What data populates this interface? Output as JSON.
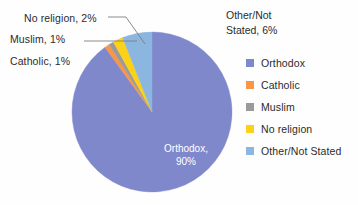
{
  "chart_data": {
    "type": "pie",
    "title": "",
    "categories": [
      "Orthodox",
      "Catholic",
      "Muslim",
      "No religion",
      "Other/Not Stated"
    ],
    "values": [
      90,
      1,
      1,
      2,
      6
    ],
    "value_unit": "%",
    "colors": [
      "#8088cc",
      "#f79646",
      "#9a9a9a",
      "#fcd116",
      "#8ab6e0"
    ],
    "legend_position": "right",
    "grid": false,
    "start_angle_deg": 0,
    "direction": "clockwise",
    "data_labels": [
      {
        "key": "noreligion",
        "text": "No religion, 2%",
        "placement": "outside-left",
        "leader": true
      },
      {
        "key": "muslim",
        "text": "Muslim, 1%",
        "placement": "outside-left",
        "leader": true
      },
      {
        "key": "catholic",
        "text": "Catholic, 1%",
        "placement": "outside-left",
        "leader": false
      },
      {
        "key": "other",
        "text_line1": "Other/Not",
        "text_line2": "Stated, 6%",
        "placement": "outside-right",
        "leader": false
      },
      {
        "key": "orthodox",
        "text_line1": "Orthodox,",
        "text_line2": "90%",
        "placement": "inside",
        "leader": false
      }
    ]
  },
  "callouts": {
    "no_religion": "No religion, 2%",
    "muslim": "Muslim, 1%",
    "catholic": "Catholic, 1%"
  },
  "other_label": {
    "line1": "Other/Not",
    "line2": "Stated, 6%"
  },
  "orthodox_label": {
    "line1": "Orthodox,",
    "line2": "90%"
  },
  "legend": {
    "items": [
      {
        "label": "Orthodox",
        "color": "#8088cc"
      },
      {
        "label": "Catholic",
        "color": "#f79646"
      },
      {
        "label": "Muslim",
        "color": "#9a9a9a"
      },
      {
        "label": "No religion",
        "color": "#fcd116"
      },
      {
        "label": "Other/Not Stated",
        "color": "#8ab6e0"
      }
    ]
  }
}
